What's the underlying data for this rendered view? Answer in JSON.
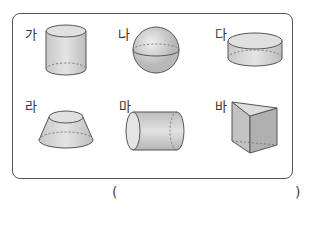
{
  "figure": {
    "items": [
      {
        "label": "가",
        "shape": "cylinder"
      },
      {
        "label": "나",
        "shape": "sphere"
      },
      {
        "label": "다",
        "shape": "short-cylinder"
      },
      {
        "label": "라",
        "shape": "truncated-cone"
      },
      {
        "label": "마",
        "shape": "horizontal-cylinder"
      },
      {
        "label": "바",
        "shape": "triangular-prism"
      }
    ]
  },
  "answer": {
    "open_paren": "(",
    "close_paren": ")"
  }
}
